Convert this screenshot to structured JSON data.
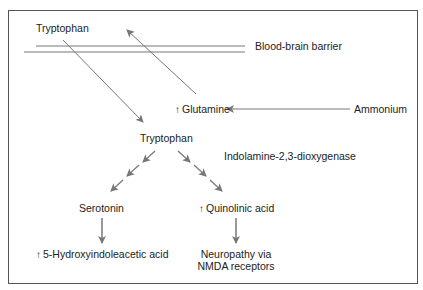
{
  "diagram": {
    "nodes": {
      "tryptophan_blood": "Tryptophan",
      "barrier_label": "Blood-brain barrier",
      "glutamine": "Glutamine",
      "ammonium": "Ammonium",
      "tryptophan_brain": "Tryptophan",
      "enzyme": "Indolamine-2,3-dioxygenase",
      "serotonin": "Serotonin",
      "quinolinic_acid": "Quinolinic acid",
      "hiaa": "5-Hydroxyindoleacetic acid",
      "neuropathy_line1": "Neuropathy via",
      "neuropathy_line2": "NMDA receptors"
    },
    "up_arrow_glyph": "↑",
    "edges": [
      {
        "from": "Tryptophan (blood)",
        "to": "Tryptophan (brain)",
        "style": "solid"
      },
      {
        "from": "Glutamine",
        "to": "Tryptophan (blood)",
        "style": "solid"
      },
      {
        "from": "Ammonium",
        "to": "Glutamine",
        "style": "solid"
      },
      {
        "from": "Tryptophan (brain)",
        "to": "Serotonin",
        "style": "multi-step"
      },
      {
        "from": "Tryptophan (brain)",
        "to": "Quinolinic acid",
        "style": "multi-step"
      },
      {
        "from": "Serotonin",
        "to": "5-Hydroxyindoleacetic acid",
        "style": "solid"
      },
      {
        "from": "Quinolinic acid",
        "to": "Neuropathy via NMDA receptors",
        "style": "solid"
      }
    ],
    "colors": {
      "line": "#777777",
      "text": "#222222",
      "border": "#555555"
    }
  }
}
